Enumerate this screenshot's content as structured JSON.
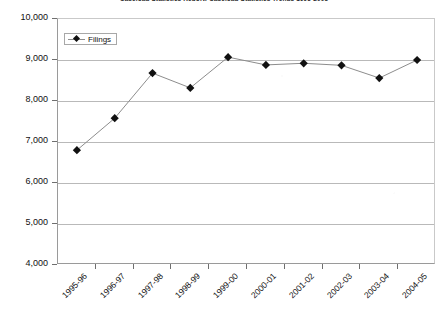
{
  "chart_data": {
    "type": "line",
    "title": "Caseload Statistics Report: Caseload Statistics Trends 1995-2005",
    "xlabel": "",
    "ylabel": "",
    "ylim": [
      4000,
      10000
    ],
    "ytick_step": 1000,
    "grid": true,
    "legend_position": "top-left",
    "categories": [
      "1995-96",
      "1996-97",
      "1997-98",
      "1998-99",
      "1999-00",
      "2000-01",
      "2001-02",
      "2002-03",
      "2003-04",
      "2004-05"
    ],
    "ytick_labels": [
      "10,000",
      "9,000",
      "8,000",
      "7,000",
      "6,000",
      "5,000",
      "4,000"
    ],
    "ytick_values": [
      10000,
      9000,
      8000,
      7000,
      6000,
      5000,
      4000
    ],
    "series": [
      {
        "name": "Filings",
        "marker": "diamond",
        "marker_color": "#111111",
        "line_color": "#8d8d8d",
        "values": [
          6800,
          7580,
          8680,
          8320,
          9070,
          8880,
          8920,
          8870,
          8560,
          9000
        ]
      }
    ]
  },
  "legend": {
    "entries": [
      {
        "label": "Filings"
      }
    ]
  }
}
